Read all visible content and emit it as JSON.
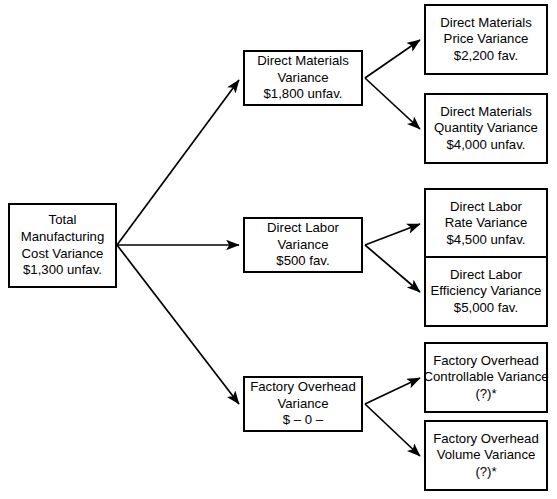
{
  "diagram": {
    "type": "tree-diagram",
    "stroke_color": "#000000",
    "background_color": "#ffffff",
    "footnote_marker": "*"
  },
  "nodes": {
    "total": {
      "name": "total-manufacturing-cost-variance",
      "lines": [
        "Total",
        "Manufacturing",
        "Cost Variance",
        "$1,300 unfav."
      ],
      "line1": "Total",
      "line2": "Manufacturing",
      "line3": "Cost Variance",
      "line4": "$1,300 unfav.",
      "amount": "$1,300 unfav.",
      "x": 8,
      "y": 203,
      "w": 109,
      "h": 85
    },
    "materials": {
      "name": "direct-materials-variance",
      "line1": "Direct Materials",
      "line2": "Variance",
      "line3": "$1,800 unfav.",
      "amount": "$1,800 unfav.",
      "x": 243,
      "y": 50,
      "w": 120,
      "h": 56
    },
    "labor": {
      "name": "direct-labor-variance",
      "line1": "Direct Labor",
      "line2": "Variance",
      "line3": "$500 fav.",
      "amount": "$500 fav.",
      "x": 243,
      "y": 217,
      "w": 120,
      "h": 56
    },
    "overhead": {
      "name": "factory-overhead-variance",
      "line1": "Factory Overhead",
      "line2": "Variance",
      "line3": "$ – 0 –",
      "amount": "$ – 0 –",
      "x": 243,
      "y": 376,
      "w": 120,
      "h": 56
    },
    "mat_price": {
      "name": "direct-materials-price-variance",
      "line1": "Direct Materials",
      "line2": "Price Variance",
      "line3": "$2,200 fav.",
      "amount": "$2,200 fav.",
      "x": 424,
      "y": 4,
      "w": 124,
      "h": 71
    },
    "mat_qty": {
      "name": "direct-materials-quantity-variance",
      "line1": "Direct Materials",
      "line2": "Quantity Variance",
      "line3": "$4,000 unfav.",
      "amount": "$4,000 unfav.",
      "x": 424,
      "y": 93,
      "w": 124,
      "h": 71
    },
    "lab_rate": {
      "name": "direct-labor-rate-variance",
      "line1": "Direct Labor",
      "line2": "Rate Variance",
      "line3": "$4,500 unfav.",
      "amount": "$4,500 unfav.",
      "x": 424,
      "y": 188,
      "w": 124,
      "h": 71
    },
    "lab_eff": {
      "name": "direct-labor-efficiency-variance",
      "line1": "Direct Labor",
      "line2": "Efficiency Variance",
      "line3": "$5,000 fav.",
      "amount": "$5,000 fav.",
      "x": 424,
      "y": 256,
      "w": 124,
      "h": 71
    },
    "oh_ctrl": {
      "name": "factory-overhead-controllable-variance",
      "line1": "Factory Overhead",
      "line2": "Controllable Variance",
      "line3": "(?)*",
      "amount": "(?)*",
      "x": 424,
      "y": 342,
      "w": 124,
      "h": 71
    },
    "oh_vol": {
      "name": "factory-overhead-volume-variance",
      "line1": "Factory Overhead",
      "line2": "Volume Variance",
      "line3": "(?)*",
      "amount": "(?)*",
      "x": 424,
      "y": 420,
      "w": 124,
      "h": 71
    }
  },
  "edges": [
    {
      "name": "edge-total-to-materials",
      "from": "total",
      "to": "materials",
      "x1": 117,
      "y1": 245,
      "x2": 239,
      "y2": 80
    },
    {
      "name": "edge-total-to-labor",
      "from": "total",
      "to": "labor",
      "x1": 117,
      "y1": 245,
      "x2": 239,
      "y2": 245
    },
    {
      "name": "edge-total-to-overhead",
      "from": "total",
      "to": "overhead",
      "x1": 117,
      "y1": 245,
      "x2": 239,
      "y2": 404
    },
    {
      "name": "edge-materials-to-price",
      "from": "materials",
      "to": "mat_price",
      "x1": 365,
      "y1": 78,
      "x2": 420,
      "y2": 40
    },
    {
      "name": "edge-materials-to-quantity",
      "from": "materials",
      "to": "mat_qty",
      "x1": 365,
      "y1": 78,
      "x2": 420,
      "y2": 129
    },
    {
      "name": "edge-labor-to-rate",
      "from": "labor",
      "to": "lab_rate",
      "x1": 365,
      "y1": 245,
      "x2": 420,
      "y2": 224
    },
    {
      "name": "edge-labor-to-efficiency",
      "from": "labor",
      "to": "lab_eff",
      "x1": 365,
      "y1": 245,
      "x2": 420,
      "y2": 292
    },
    {
      "name": "edge-overhead-to-controllable",
      "from": "overhead",
      "to": "oh_ctrl",
      "x1": 365,
      "y1": 404,
      "x2": 420,
      "y2": 378
    },
    {
      "name": "edge-overhead-to-volume",
      "from": "overhead",
      "to": "oh_vol",
      "x1": 365,
      "y1": 404,
      "x2": 420,
      "y2": 456
    }
  ]
}
